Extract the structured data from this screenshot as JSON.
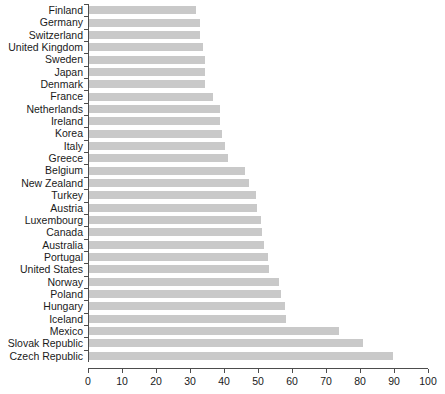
{
  "chart_data": {
    "type": "bar",
    "orientation": "horizontal",
    "title": "",
    "subtitle": "",
    "xlabel": "",
    "ylabel": "",
    "xlim": [
      0,
      100
    ],
    "ylim": null,
    "grid": false,
    "legend": null,
    "bar_color": "#c9c9c9",
    "axis_color": "#4d4d4d",
    "text_color": "#1a1a1a",
    "xticks": [
      0,
      10,
      20,
      30,
      40,
      50,
      60,
      70,
      80,
      90,
      100
    ],
    "xticklabels": [
      "0",
      "10",
      "20",
      "30",
      "40",
      "50",
      "60",
      "70",
      "80",
      "90",
      "100"
    ],
    "categories": [
      "Finland",
      "Germany",
      "Switzerland",
      "United Kingdom",
      "Sweden",
      "Japan",
      "Denmark",
      "France",
      "Netherlands",
      "Ireland",
      "Korea",
      "Italy",
      "Greece",
      "Belgium",
      "New Zealand",
      "Turkey",
      "Austria",
      "Luxembourg",
      "Canada",
      "Australia",
      "Portugal",
      "United States",
      "Norway",
      "Poland",
      "Hungary",
      "Iceland",
      "Mexico",
      "Slovak Republic",
      "Czech Republic"
    ],
    "values": [
      31.5,
      32.5,
      32.5,
      33.5,
      34,
      34,
      34,
      36.5,
      38.5,
      38.5,
      39,
      40,
      41,
      46,
      47,
      49,
      49.5,
      50.5,
      51,
      51.5,
      52.5,
      53,
      56,
      56.5,
      57.5,
      58,
      73.5,
      80.5,
      89.5
    ]
  }
}
